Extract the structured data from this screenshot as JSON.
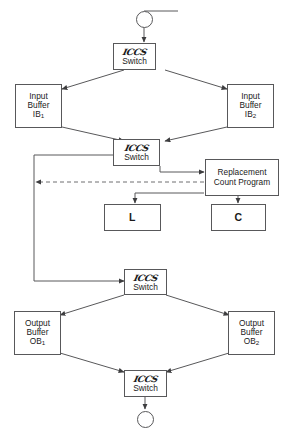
{
  "diagram": {
    "colors": {
      "stroke": "#58585a",
      "text": "#1a1a1a",
      "background": "#ffffff",
      "dashed": "#6e6e70"
    },
    "nodes": {
      "start_terminal": {
        "shape": "circle",
        "label": ""
      },
      "end_terminal": {
        "shape": "circle",
        "label": ""
      },
      "switch_1": {
        "script": "ICCS",
        "label": "Switch"
      },
      "switch_2": {
        "script": "ICCS",
        "label": "Switch"
      },
      "switch_3": {
        "script": "ICCS",
        "label": "Switch"
      },
      "switch_4": {
        "script": "ICCS",
        "label": "Switch"
      },
      "input_buffer_1": {
        "line1": "Input",
        "line2": "Buffer",
        "name": "IB",
        "sub": "1"
      },
      "input_buffer_2": {
        "line1": "Input",
        "line2": "Buffer",
        "name": "IB",
        "sub": "2"
      },
      "output_buffer_1": {
        "line1": "Output",
        "line2": "Buffer",
        "name": "OB",
        "sub": "1"
      },
      "output_buffer_2": {
        "line1": "Output",
        "line2": "Buffer",
        "name": "OB",
        "sub": "2"
      },
      "replacement_count_program": {
        "line1": "Replacement",
        "line2": "Count Program"
      },
      "box_l": {
        "label": "L"
      },
      "box_c": {
        "label": "C"
      }
    },
    "edges": [
      {
        "from": "start_terminal",
        "to": "switch_1",
        "style": "solid"
      },
      {
        "from": "switch_1",
        "to": "input_buffer_1",
        "style": "solid"
      },
      {
        "from": "switch_1",
        "to": "input_buffer_2",
        "style": "solid"
      },
      {
        "from": "input_buffer_1",
        "to": "switch_2",
        "style": "solid"
      },
      {
        "from": "input_buffer_2",
        "to": "switch_2",
        "style": "solid"
      },
      {
        "from": "switch_2",
        "to": "replacement_count_program",
        "style": "solid"
      },
      {
        "from": "replacement_count_program",
        "to": "left_bus",
        "style": "dashed"
      },
      {
        "from": "replacement_count_program",
        "to": "box_l",
        "style": "solid"
      },
      {
        "from": "replacement_count_program",
        "to": "box_c",
        "style": "solid"
      },
      {
        "from": "left_bus",
        "to": "switch_3",
        "style": "solid"
      },
      {
        "from": "switch_3",
        "to": "output_buffer_1",
        "style": "solid"
      },
      {
        "from": "switch_3",
        "to": "output_buffer_2",
        "style": "solid"
      },
      {
        "from": "output_buffer_1",
        "to": "switch_4",
        "style": "solid"
      },
      {
        "from": "output_buffer_2",
        "to": "switch_4",
        "style": "solid"
      },
      {
        "from": "switch_4",
        "to": "end_terminal",
        "style": "solid"
      }
    ]
  }
}
